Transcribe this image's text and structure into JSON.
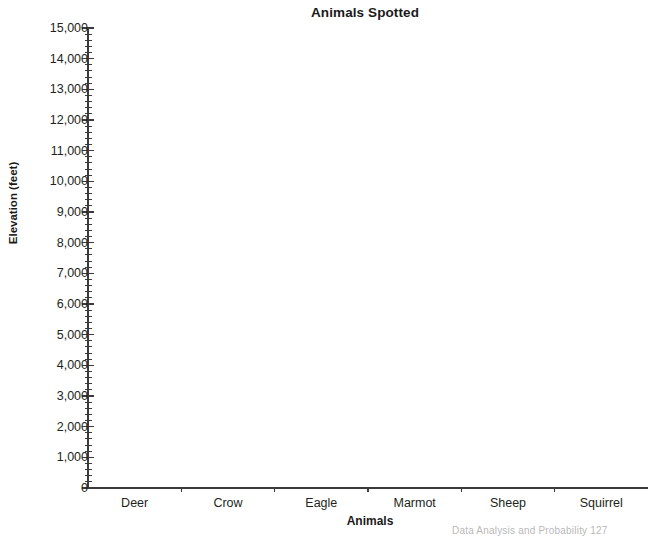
{
  "chart_data": {
    "type": "bar",
    "title": "Animals Spotted",
    "xlabel": "Animals",
    "ylabel": "Elevation (feet)",
    "categories": [
      "Deer",
      "Crow",
      "Eagle",
      "Marmot",
      "Sheep",
      "Squirrel"
    ],
    "values": [
      0,
      0,
      0,
      0,
      0,
      0
    ],
    "ylim": [
      0,
      15000
    ],
    "ytick_labels": [
      "0",
      "1,000",
      "2,000",
      "3,000",
      "4,000",
      "5,000",
      "6,000",
      "7,000",
      "8,000",
      "9,000",
      "10,000",
      "11,000",
      "12,000",
      "13,000",
      "14,000",
      "15,000"
    ],
    "ytick_values": [
      0,
      1000,
      2000,
      3000,
      4000,
      5000,
      6000,
      7000,
      8000,
      9000,
      10000,
      11000,
      12000,
      13000,
      14000,
      15000
    ],
    "y_major_step": 1000,
    "y_minor_step": 200,
    "grid": false,
    "legend": null,
    "axis_color": "#3a3a3a",
    "text_color": "#231f20",
    "background": "#ffffff",
    "note": "blank axes template — no bars drawn"
  },
  "footer": {
    "text": "Data Analysis and Probability   127"
  }
}
